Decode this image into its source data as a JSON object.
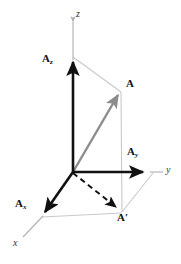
{
  "figure": {
    "width": 181,
    "height": 264,
    "background_color": "#ffffff"
  },
  "colors": {
    "bold_vector": "#111111",
    "resultant_vector": "#8c8c8c",
    "construction_line": "#c9c9c9",
    "axis_line": "#b0b0b0",
    "label_text": "#111111",
    "axis_label_text": "#333333"
  },
  "axes": [
    {
      "id": "x",
      "label": "x",
      "label_style": "italic",
      "label_x": 14,
      "label_y": 243
    },
    {
      "id": "y",
      "label": "y",
      "label_style": "italic",
      "label_x": 166,
      "label_y": 169
    },
    {
      "id": "z",
      "label": "z",
      "label_style": "italic",
      "label_x": 76,
      "label_y": 14
    }
  ],
  "vectors": [
    {
      "id": "A",
      "label": "A",
      "subscript": "",
      "prime": false,
      "style": "resultant",
      "color": "#8c8c8c",
      "from": {
        "x": 73,
        "y": 172
      },
      "to": {
        "x": 121,
        "y": 91
      },
      "label_x": 127,
      "label_y": 83
    },
    {
      "id": "Ax",
      "label": "A",
      "subscript": "x",
      "prime": false,
      "style": "component",
      "color": "#111111",
      "from": {
        "x": 73,
        "y": 172
      },
      "to": {
        "x": 42,
        "y": 216
      },
      "label_x": 16,
      "label_y": 204
    },
    {
      "id": "Ay",
      "label": "A",
      "subscript": "y",
      "prime": false,
      "style": "component",
      "color": "#111111",
      "from": {
        "x": 73,
        "y": 172
      },
      "to": {
        "x": 148,
        "y": 172
      },
      "label_x": 130,
      "label_y": 152
    },
    {
      "id": "Az",
      "label": "A",
      "subscript": "z",
      "prime": false,
      "style": "component",
      "color": "#111111",
      "from": {
        "x": 73,
        "y": 172
      },
      "to": {
        "x": 73,
        "y": 55
      },
      "label_x": 44,
      "label_y": 59
    },
    {
      "id": "Aprime",
      "label": "A",
      "subscript": "",
      "prime": true,
      "style": "projection",
      "color": "#111111",
      "dashed": true,
      "from": {
        "x": 73,
        "y": 172
      },
      "to": {
        "x": 120,
        "y": 211
      },
      "label_x": 118,
      "label_y": 217
    }
  ],
  "construction_lines": [
    {
      "id": "Az-to-A",
      "from": {
        "x": 73,
        "y": 57
      },
      "to": {
        "x": 121,
        "y": 92
      }
    },
    {
      "id": "A-to-Aprime",
      "from": {
        "x": 121,
        "y": 92
      },
      "to": {
        "x": 122,
        "y": 212
      }
    },
    {
      "id": "Ax-to-Aprime",
      "from": {
        "x": 42,
        "y": 217
      },
      "to": {
        "x": 122,
        "y": 213
      }
    },
    {
      "id": "Ay-to-Aprime",
      "from": {
        "x": 153,
        "y": 173
      },
      "to": {
        "x": 122,
        "y": 212
      }
    }
  ],
  "axis_segments": [
    {
      "id": "z-axis-upper",
      "from": {
        "x": 73,
        "y": 20
      },
      "to": {
        "x": 73,
        "y": 55
      }
    },
    {
      "id": "y-axis-outer",
      "from": {
        "x": 148,
        "y": 172
      },
      "to": {
        "x": 163,
        "y": 172
      }
    },
    {
      "id": "x-axis-outer",
      "from": {
        "x": 42,
        "y": 216
      },
      "to": {
        "x": 22,
        "y": 238
      }
    }
  ]
}
